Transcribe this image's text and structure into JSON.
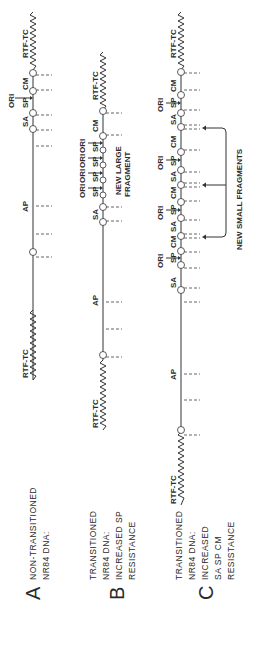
{
  "panels": [
    {
      "letter": "A",
      "title_lines": [
        "NON-TRANSITIONED",
        "NR84 DNA:"
      ],
      "labels": {
        "rtf_top": "RTF-TC",
        "rtf_bottom": "RTF-TC",
        "ori": "ORI",
        "sp": "SP",
        "sa": "SA",
        "cm": "CM",
        "ap": "AP"
      }
    },
    {
      "letter": "B",
      "title_lines": [
        "TRANSITIONED",
        "NR84 DNA:",
        "INCREASED SP",
        "RESISTANCE"
      ],
      "labels": {
        "rtf_top": "RTF-TC",
        "rtf_bottom": "RTF-TC",
        "ori": "ORI",
        "sp": "SP",
        "sa": "SA",
        "cm": "CM",
        "ap": "AP"
      },
      "annotation": [
        "NEW LARGE",
        "FRAGMENT"
      ]
    },
    {
      "letter": "C",
      "title_lines": [
        "TRANSITIONED",
        "NR84 DNA:",
        "INCREASED",
        "SA SP CM",
        "RESISTANCE"
      ],
      "labels": {
        "rtf_top": "RTF-TC",
        "rtf_bottom": "RTF-TC",
        "ori": "ORI",
        "sp": "SP",
        "sa": "SA",
        "cm": "CM",
        "ap": "AP"
      },
      "annotation": "NEW SMALL FRAGMENTS"
    }
  ],
  "circle_numbers": [
    "1",
    "2",
    "3",
    "4",
    "5"
  ]
}
